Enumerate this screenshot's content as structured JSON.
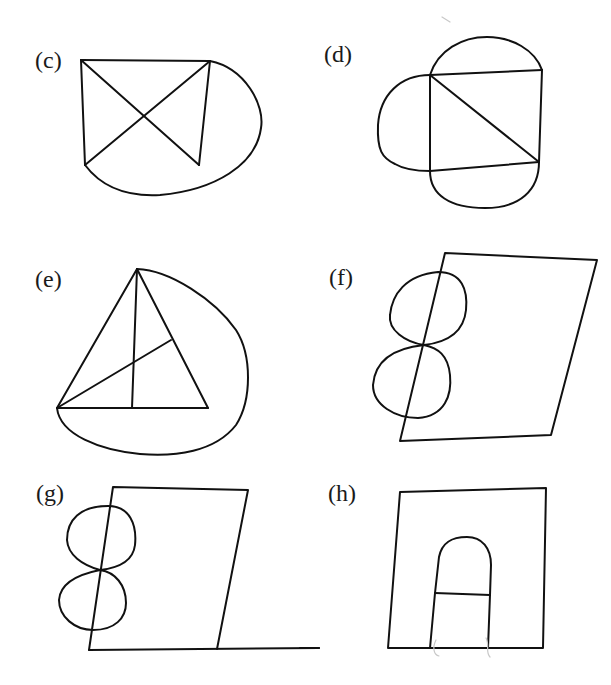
{
  "figures": {
    "c": {
      "label": "(c)",
      "description": "Rectangle with both diagonals, with an outer curved edge from top-right corner around to bottom-left corner"
    },
    "d": {
      "label": "(d)",
      "description": "Square with one diagonal and three outer semicircular arcs on top, left and bottom sides"
    },
    "e": {
      "label": "(e)",
      "description": "Triangle with a vertical line from apex and a line from the left vertex to the right side, plus an outer curve from apex to left vertex"
    },
    "f": {
      "label": "(f)",
      "description": "Parallelogram with a figure-eight drawn across its left side"
    },
    "g": {
      "label": "(g)",
      "description": "Quadrilateral with a figure-eight across its left side and a baseline extending to the right"
    },
    "h": {
      "label": "(h)",
      "description": "Square containing an arch shape with a horizontal bar"
    }
  },
  "style": {
    "stroke_color": "#111111",
    "background": "#ffffff"
  }
}
